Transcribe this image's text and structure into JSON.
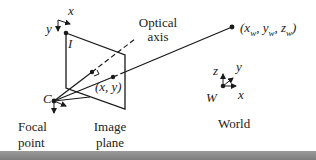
{
  "diagram": {
    "labels": {
      "optical_axis_1": "Optical",
      "optical_axis_2": "axis",
      "image_corner": "I",
      "axis_x_image": "x",
      "axis_y_image": "y",
      "focal_point_symbol": "C",
      "image_point": "(x, y)",
      "focal_point_1": "Focal",
      "focal_point_2": "point",
      "image_plane_1": "Image",
      "image_plane_2": "plane",
      "world_point": "(x",
      "world_point_full": "(xw, yw, zw)",
      "world_origin": "W",
      "world_axis_x": "x",
      "world_axis_y": "y",
      "world_axis_z": "z",
      "world": "World"
    },
    "colors": {
      "ink": "#1a1a1a",
      "bottom_bar": "#8a8a8a"
    }
  }
}
